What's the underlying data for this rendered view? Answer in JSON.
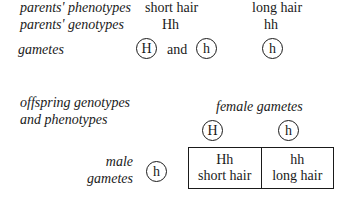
{
  "parents": {
    "phenotypes_label": "parents' phenotypes",
    "genotypes_label": "parents' genotypes",
    "parent1": {
      "phenotype": "short hair",
      "genotype": "Hh"
    },
    "parent2": {
      "phenotype": "long hair",
      "genotype": "hh"
    }
  },
  "gametes": {
    "label": "gametes",
    "parent1": [
      "H",
      "h"
    ],
    "connector": "and",
    "parent2": [
      "h"
    ]
  },
  "offspring": {
    "label_line1": "offspring genotypes",
    "label_line2": "and phenotypes",
    "female_gametes_label": "female gametes",
    "female_gametes": [
      "H",
      "h"
    ],
    "male_gametes_label_line1": "male",
    "male_gametes_label_line2": "gametes",
    "male_gametes": [
      "h"
    ],
    "punnett": [
      {
        "genotype": "Hh",
        "phenotype": "short hair"
      },
      {
        "genotype": "hh",
        "phenotype": "long hair"
      }
    ]
  }
}
